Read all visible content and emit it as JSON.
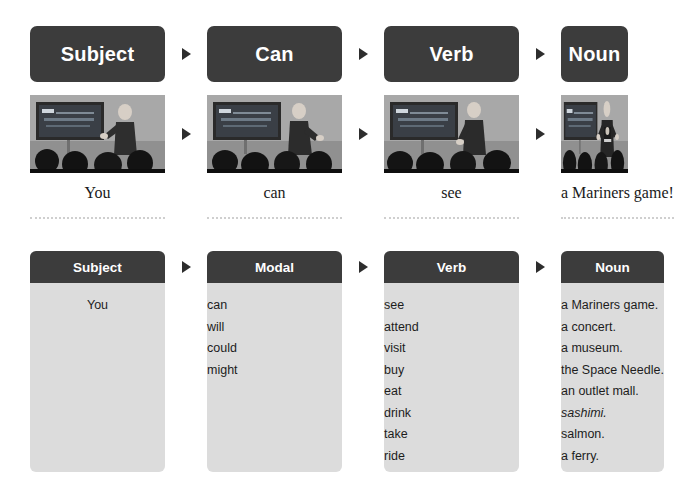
{
  "top_sequence": {
    "chips": [
      {
        "label": "Subject"
      },
      {
        "label": "Can"
      },
      {
        "label": "Verb"
      },
      {
        "label": "Noun"
      }
    ],
    "arrow_icon": "triangle-right-icon"
  },
  "photos": [
    {
      "alt": "presenter-gesturing-toward-audience"
    },
    {
      "alt": "presenter-leaning-on-podium"
    },
    {
      "alt": "presenter-standing-beside-screen"
    },
    {
      "alt": "presenter-holding-team-shirt"
    }
  ],
  "captions": [
    {
      "text": "You"
    },
    {
      "text": "can"
    },
    {
      "text": "see"
    },
    {
      "text": "a Mariners game!"
    }
  ],
  "tables": [
    {
      "header": "Subject",
      "items": [
        "You"
      ]
    },
    {
      "header": "Modal",
      "items": [
        "can",
        "will",
        "could",
        "might"
      ]
    },
    {
      "header": "Verb",
      "items": [
        "see",
        "attend",
        "visit",
        "buy",
        "eat",
        "drink",
        "take",
        "ride"
      ]
    },
    {
      "header": "Noun",
      "items": [
        "a Mariners game.",
        "a concert.",
        "a museum.",
        "the Space Needle.",
        "an outlet mall.",
        "sashimi.",
        "salmon.",
        "a ferry."
      ],
      "italic_indices": [
        5
      ]
    }
  ],
  "colors": {
    "chip_background": "#3c3c3c",
    "chip_text": "#ffffff",
    "panel_background": "#dcdcdc",
    "page_background": "#ffffff",
    "divider": "#cfcfcf"
  }
}
